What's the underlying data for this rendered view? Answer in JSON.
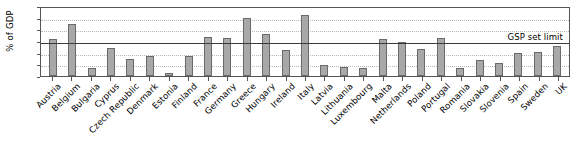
{
  "chart_data": {
    "type": "bar",
    "title": "",
    "xlabel": "",
    "ylabel": "% of GDP",
    "ylim": [
      0,
      120
    ],
    "yticks": [
      0,
      20,
      40,
      60,
      80,
      100,
      120
    ],
    "grid": true,
    "legend": "none",
    "categories": [
      "Austria",
      "Belgium",
      "Bulgaria",
      "Cyprus",
      "Czech Republic",
      "Denmark",
      "Estonia",
      "Finland",
      "France",
      "Germany",
      "Greece",
      "Hungary",
      "Ireland",
      "Italy",
      "Latvia",
      "Lithuania",
      "Luxembourg",
      "Malta",
      "Netherlands",
      "Poland",
      "Portugal",
      "Romania",
      "Slovakia",
      "Slovenia",
      "Spain",
      "Sweden",
      "UK"
    ],
    "values": [
      63,
      89,
      14,
      48,
      30,
      35,
      5,
      35,
      67,
      66,
      100,
      72,
      44,
      104,
      19,
      16,
      14,
      63,
      58,
      47,
      66,
      13,
      28,
      23,
      40,
      42,
      52
    ],
    "annotations": [
      {
        "label": "GSP set limit",
        "value": 60,
        "type": "reference-line"
      }
    ]
  }
}
